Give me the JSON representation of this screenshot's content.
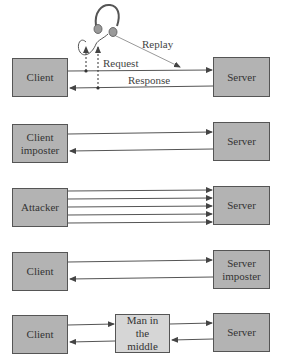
{
  "diagram": {
    "type": "attack-scenarios",
    "colors": {
      "box_fill": "#b3b3b3",
      "mitm_fill": "#d6d6d6",
      "line": "#555555",
      "replay_line": "#999999"
    },
    "rows": [
      {
        "name": "eavesdropping-replay",
        "left": "Client",
        "right": "Server",
        "labels": {
          "request": "Request",
          "response": "Response",
          "replay": "Replay"
        },
        "icon": "headphones-icon"
      },
      {
        "name": "client-impersonation",
        "left": "Client imposter",
        "right": "Server"
      },
      {
        "name": "flooding",
        "left": "Attacker",
        "right": "Server",
        "arrow_count": 5
      },
      {
        "name": "server-impersonation",
        "left": "Client",
        "right": "Server imposter"
      },
      {
        "name": "man-in-the-middle",
        "left": "Client",
        "middle": "Man in the middle",
        "right": "Server"
      }
    ]
  }
}
